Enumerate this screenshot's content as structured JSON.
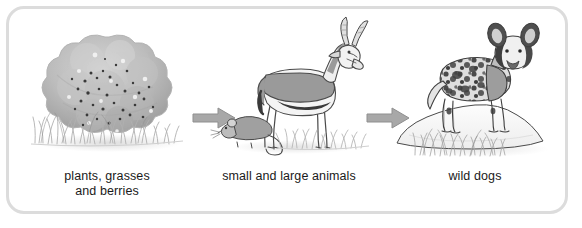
{
  "diagram": {
    "type": "food-chain",
    "title": "",
    "panel": {
      "background_color": "#ffffff",
      "border_color": "#dcdcdc"
    },
    "stages": [
      {
        "id": "plants",
        "caption_line_1": "plants, grasses",
        "caption_line_2": "and berries",
        "illustration": "berry-bush-with-grass",
        "elements": [
          "bush",
          "berries",
          "grass",
          "ground-shadow"
        ]
      },
      {
        "id": "animals",
        "caption_line_1": "small and large animals",
        "caption_line_2": "",
        "illustration": "antelope-and-mouse",
        "elements": [
          "springbok",
          "horns",
          "mouse",
          "grass",
          "ground-shadow"
        ]
      },
      {
        "id": "wild-dogs",
        "caption_line_1": "wild dogs",
        "caption_line_2": "",
        "illustration": "wild-dog-on-mound",
        "elements": [
          "african-wild-dog",
          "mound",
          "grass"
        ]
      }
    ],
    "arrows": [
      {
        "id": "arrow-1",
        "direction": "right",
        "from": "plants",
        "to": "animals"
      },
      {
        "id": "arrow-2",
        "direction": "right",
        "from": "animals",
        "to": "wild-dogs"
      }
    ],
    "colors": {
      "arrow_fill": "#a8a8a8",
      "arrow_stroke": "#8f8f8f",
      "text": "#1a1a1a",
      "bush_light": "#c9c9c9",
      "bush_mid": "#b0b0b0",
      "bush_dark": "#8e8e8e",
      "berry": "#3d3d3d",
      "animal_body": "#9a9a9a",
      "animal_shade": "#3a3a3a",
      "animal_light": "#f2f2f2",
      "grass": "#bdbdbd",
      "mound": "#fafafa",
      "outline": "#4a4a4a"
    }
  }
}
